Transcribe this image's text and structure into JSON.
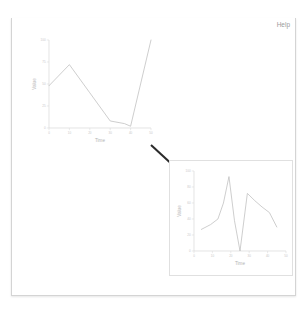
{
  "window": {
    "title": "Roassal",
    "controls": [
      {
        "name": "close",
        "glyph": "x"
      },
      {
        "name": "minimize",
        "glyph": "–"
      },
      {
        "name": "maximize",
        "glyph": "□"
      }
    ],
    "menu_caret": "▾"
  },
  "content": {
    "help_label": "Help"
  },
  "colors": {
    "titlebar_top": "#f4f4f4",
    "titlebar_bottom": "#dcdcdc",
    "window_border": "#d4d4d4",
    "line": "#bdbdbd",
    "axis": "#d9d9d9",
    "arrow": "#2b2b2b",
    "help_text": "#9a9a9a"
  },
  "chart_data": [
    {
      "id": "chart1",
      "type": "line",
      "title": "",
      "xlabel": "Time",
      "ylabel": "Value",
      "xlim": [
        0,
        50
      ],
      "ylim": [
        0,
        100
      ],
      "grid": false,
      "legend": null,
      "xticks": [
        0,
        10,
        20,
        30,
        40,
        50
      ],
      "xticklabels": [
        "0",
        "10",
        "20",
        "30",
        "40",
        "50"
      ],
      "yticks": [
        0,
        25,
        50,
        75,
        100
      ],
      "yticklabels": [
        "0",
        "25",
        "50",
        "75",
        "100"
      ],
      "x": [
        0,
        10,
        20,
        30,
        37,
        40,
        50
      ],
      "values": [
        48,
        72,
        40,
        8,
        5,
        2,
        100
      ]
    },
    {
      "id": "chart2",
      "type": "line",
      "title": "",
      "xlabel": "Time",
      "ylabel": "Value",
      "xlim": [
        0,
        50
      ],
      "ylim": [
        0,
        100
      ],
      "grid": false,
      "legend": null,
      "xticks": [
        0,
        10,
        20,
        30,
        40,
        50
      ],
      "xticklabels": [
        "0",
        "10",
        "20",
        "30",
        "40",
        "50"
      ],
      "yticks": [
        0,
        20,
        40,
        60,
        80,
        100
      ],
      "yticklabels": [
        "0",
        "20",
        "40",
        "60",
        "80",
        "100"
      ],
      "x": [
        4,
        9,
        13,
        16,
        19,
        22,
        25,
        29,
        33,
        37,
        41,
        45
      ],
      "values": [
        27,
        33,
        40,
        60,
        93,
        38,
        0,
        72,
        63,
        55,
        48,
        30
      ]
    }
  ]
}
